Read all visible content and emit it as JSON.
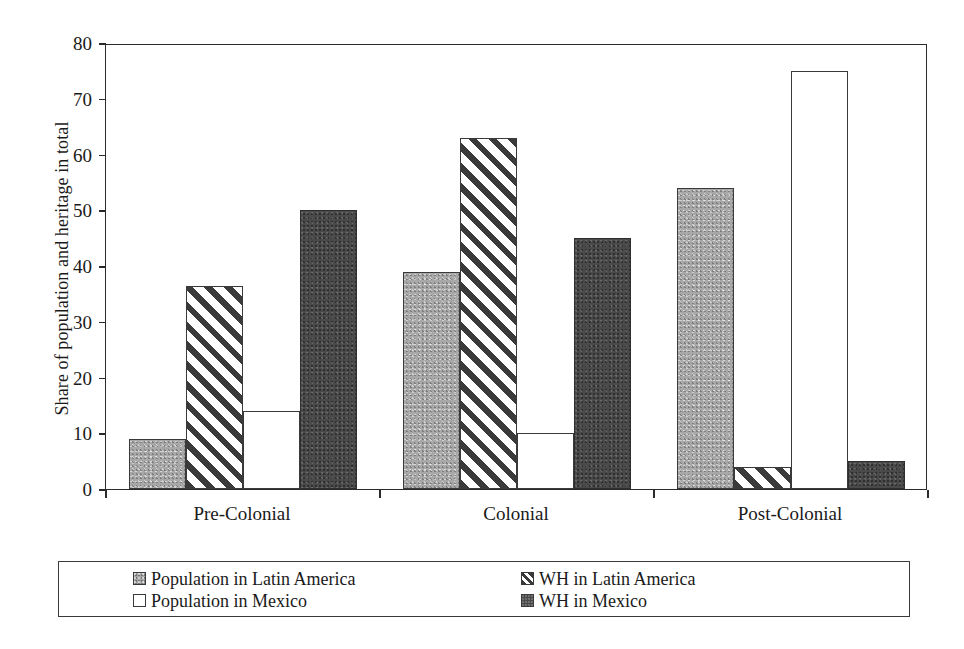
{
  "chart_data": {
    "type": "bar",
    "title": "",
    "subtitle": "",
    "xlabel": "",
    "ylabel": "Share of population and heritage in total",
    "categories": [
      "Pre-Colonial",
      "Colonial",
      "Post-Colonial"
    ],
    "series": [
      {
        "name": "Population in Latin America",
        "key": "pop-la",
        "values": [
          9,
          39,
          54
        ]
      },
      {
        "name": "WH in Latin America",
        "key": "wh-la",
        "values": [
          36.5,
          63,
          4
        ]
      },
      {
        "name": "Population in Mexico",
        "key": "pop-mx",
        "values": [
          14,
          10,
          75
        ]
      },
      {
        "name": "WH in Mexico",
        "key": "wh-mx",
        "values": [
          50,
          45,
          5
        ]
      }
    ],
    "ylim": [
      0,
      80
    ],
    "yticks": [
      0,
      10,
      20,
      30,
      40,
      50,
      60,
      70,
      80
    ],
    "ytick_labels": [
      "0",
      "10",
      "20",
      "30",
      "40",
      "50",
      "60",
      "70",
      "80"
    ],
    "grid": false,
    "legend_position": "bottom",
    "legend_entries": [
      {
        "label": "Population in Latin America",
        "key": "pop-la"
      },
      {
        "label": "Population in Mexico",
        "key": "pop-mx"
      },
      {
        "label": "WH in Latin America",
        "key": "wh-la"
      },
      {
        "label": "WH in Mexico",
        "key": "wh-mx"
      }
    ],
    "colors": {
      "pop-la": "#a8a8a8",
      "pop-mx": "#ffffff",
      "wh-la": "#3a3a3a",
      "wh-mx": "#4a4a4a",
      "axis": "#2b2b2b",
      "background": "#ffffff"
    }
  }
}
